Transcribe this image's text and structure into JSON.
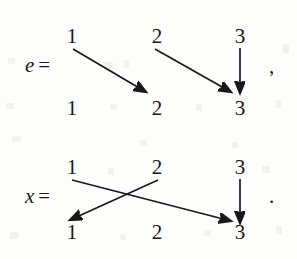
{
  "figure": {
    "kind": "permutation-two-line-diagram",
    "background_color": "#fdfdfc",
    "ink_color": "#18181a",
    "diagrams": [
      {
        "id": "e",
        "label": "e",
        "equals": "=",
        "top_row": [
          "1",
          "2",
          "3"
        ],
        "bottom_row": [
          "1",
          "2",
          "3"
        ],
        "trailing_punctuation": ",",
        "mappings": [
          {
            "from": "1",
            "to": "2",
            "type": "diagonal-right"
          },
          {
            "from": "2",
            "to": "3",
            "type": "diagonal-right"
          },
          {
            "from": "3",
            "to": "3",
            "type": "vertical"
          }
        ]
      },
      {
        "id": "x",
        "label": "x",
        "equals": "=",
        "top_row": [
          "1",
          "2",
          "3"
        ],
        "bottom_row": [
          "1",
          "2",
          "3"
        ],
        "trailing_punctuation": ".",
        "mappings": [
          {
            "from": "1",
            "to": "3",
            "type": "diagonal-right"
          },
          {
            "from": "2",
            "to": "1",
            "type": "diagonal-left"
          },
          {
            "from": "3",
            "to": "3",
            "type": "vertical"
          }
        ]
      }
    ]
  }
}
